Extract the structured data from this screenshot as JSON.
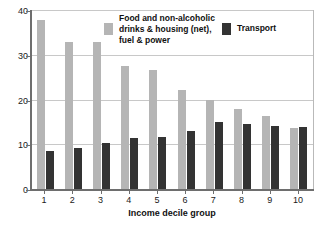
{
  "chart_data": {
    "type": "bar",
    "title": "",
    "xlabel": "Income decile group",
    "ylabel": "",
    "categories": [
      "1",
      "2",
      "3",
      "4",
      "5",
      "6",
      "7",
      "8",
      "9",
      "10"
    ],
    "series": [
      {
        "name": "Food and non-alcoholic\ndrinks & housing (net),\nfuel & power",
        "color": "#b5b5b5",
        "values": [
          38.0,
          33.1,
          33.1,
          27.8,
          26.9,
          22.4,
          20.2,
          18.0,
          16.5,
          13.9
        ]
      },
      {
        "name": "Transport",
        "color": "#333333",
        "values": [
          8.7,
          9.4,
          10.4,
          11.6,
          11.9,
          13.1,
          15.3,
          14.8,
          14.4,
          14.1
        ]
      }
    ],
    "ylim": [
      0,
      40
    ],
    "yticks": [
      0,
      10,
      20,
      30,
      40
    ],
    "ytick_labels": [
      "0",
      "10",
      "20",
      "30",
      "40"
    ],
    "grid": true,
    "legend_position": "top-center"
  },
  "axes": {
    "x_title": "Income decile group"
  },
  "legend": {
    "entries": [
      {
        "label": "Food and non-alcoholic\ndrinks & housing (net),\nfuel & power",
        "color": "#b5b5b5"
      },
      {
        "label": "Transport",
        "color": "#333333"
      }
    ]
  }
}
